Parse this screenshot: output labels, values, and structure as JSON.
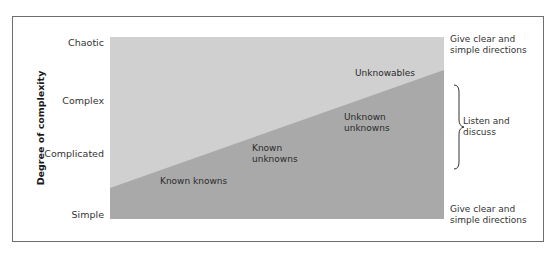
{
  "diagram": {
    "top_clipped_text": "… ty…",
    "y_axis_title": "Degree of complexity",
    "y_levels": [
      {
        "label": "Chaotic"
      },
      {
        "label": "Complex"
      },
      {
        "label": "Complicated"
      },
      {
        "label": "Simple"
      }
    ],
    "regions": [
      {
        "label": "Unknowables",
        "line1": "Unknowables",
        "line2": ""
      },
      {
        "label": "Unknown unknowns",
        "line1": "Unknown",
        "line2": "unknowns"
      },
      {
        "label": "Known unknowns",
        "line1": "Known",
        "line2": "unknowns"
      },
      {
        "label": "Known knowns",
        "line1": "Known knowns",
        "line2": ""
      }
    ],
    "right_notes": {
      "top": {
        "line1": "Give clear and",
        "line2": "simple directions"
      },
      "middle": {
        "line1": "Listen and",
        "line2": "discuss"
      },
      "bottom": {
        "line1": "Give clear and",
        "line2": "simple directions"
      }
    },
    "colors": {
      "upper_area": "#d0d0d0",
      "lower_area": "#a9a9a9",
      "frame_border": "#6e6e6e",
      "text": "#2a2a2a"
    }
  }
}
